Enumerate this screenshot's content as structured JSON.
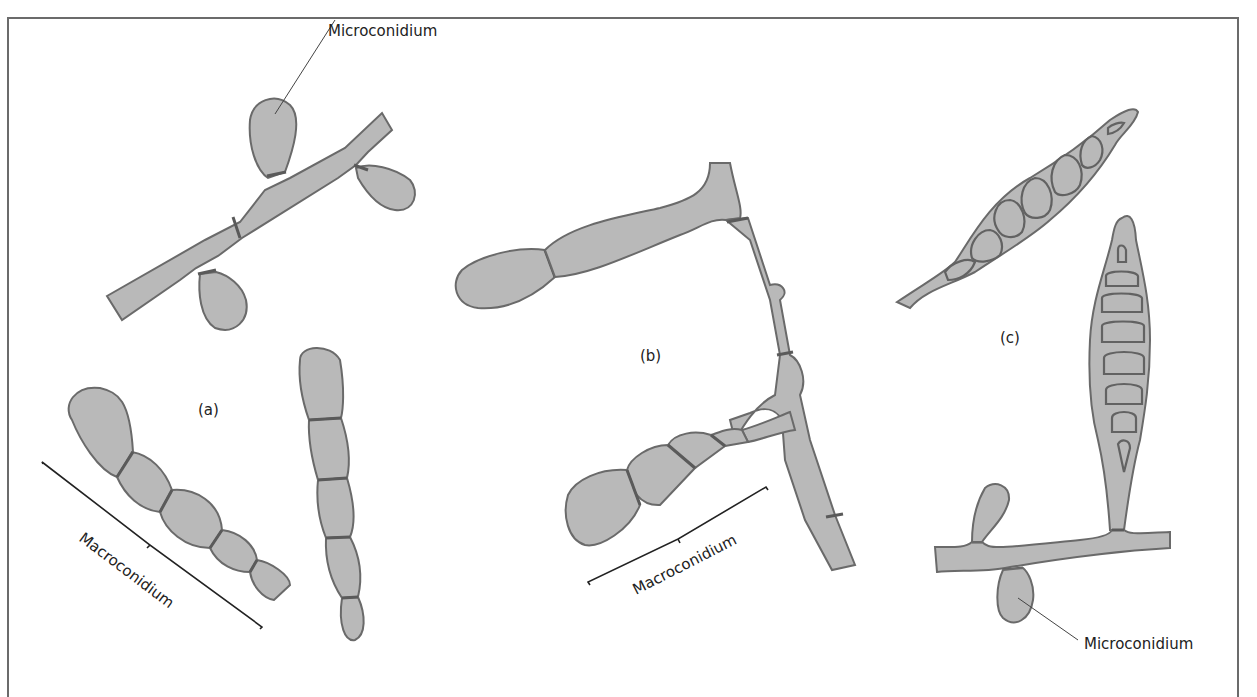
{
  "figure": {
    "panels": [
      {
        "id": "a",
        "label": "(a)"
      },
      {
        "id": "b",
        "label": "(b)"
      },
      {
        "id": "c",
        "label": "(c)"
      }
    ],
    "annotations": {
      "micro_a": "Microconidium",
      "macro_a": "Macroconidium",
      "macro_b": "Macroconidium",
      "micro_c": "Microconidium"
    },
    "colors": {
      "cell_fill": "#b9b9b9",
      "cell_stroke": "#6a6a6a",
      "frame": "#6b6b6b"
    }
  }
}
